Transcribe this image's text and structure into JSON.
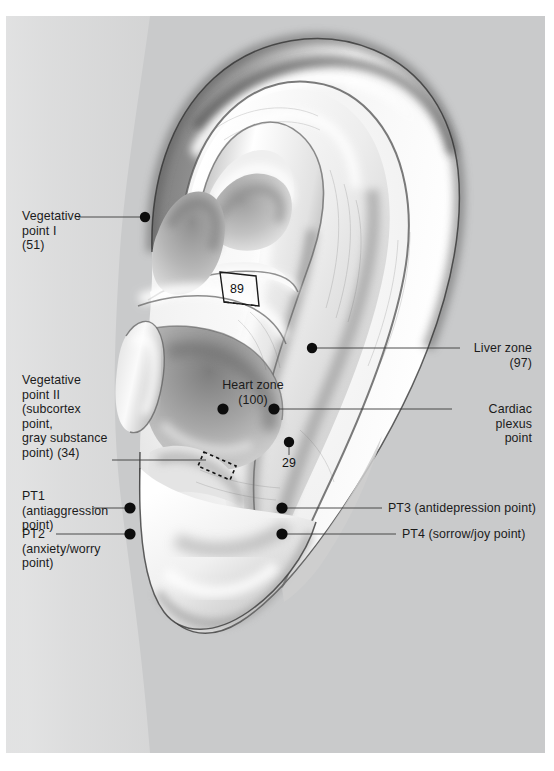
{
  "figure": {
    "kind": "anatomical-illustration",
    "background_color": "#ffffff",
    "panel_color": "#c9cacb",
    "ink_color": "#1b1b1b"
  },
  "labels": {
    "vegetative_point_1": "Vegetative\npoint I\n(51)",
    "vegetative_point_2": "Vegetative\npoint II\n(subcortex\npoint,\ngray substance\npoint) (34)",
    "pt1": "PT1\n(antiaggression\npoint)",
    "pt2": "PT2\n(anxiety/worry\npoint)",
    "liver_zone": "Liver zone\n(97)",
    "cardiac_plexus": "Cardiac\nplexus\npoint",
    "pt3": "PT3 (antidepression point)",
    "pt4": "PT4 (sorrow/joy point)",
    "heart_zone": "Heart zone\n(100)",
    "marker_29": "29",
    "marker_89": "89"
  },
  "points": [
    {
      "name": "vegetative-point-1",
      "x": 145,
      "y": 217
    },
    {
      "name": "liver-zone",
      "x": 312,
      "y": 348
    },
    {
      "name": "heart-zone",
      "x": 223,
      "y": 409
    },
    {
      "name": "cardiac-plexus-point",
      "x": 274,
      "y": 409
    },
    {
      "name": "point-29",
      "x": 289,
      "y": 442
    },
    {
      "name": "pt1",
      "x": 130,
      "y": 508
    },
    {
      "name": "pt2",
      "x": 130,
      "y": 534
    },
    {
      "name": "pt3",
      "x": 282,
      "y": 508
    },
    {
      "name": "pt4",
      "x": 282,
      "y": 534
    }
  ]
}
